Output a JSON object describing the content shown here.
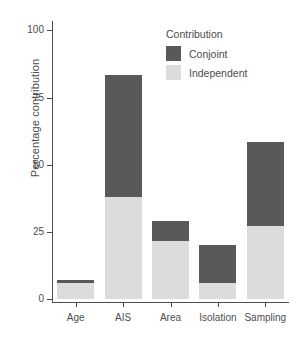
{
  "chart_data": {
    "type": "bar",
    "subtype": "stacked",
    "title": "",
    "xlabel": "",
    "ylabel": "Percentage contribution",
    "categories": [
      "Age",
      "AIS",
      "Area",
      "Isolation",
      "Sampling"
    ],
    "series": [
      {
        "name": "Independent",
        "color": "#dcdcdc",
        "values": [
          6,
          38,
          21.5,
          6,
          27
        ]
      },
      {
        "name": "Conjoint",
        "color": "#595959",
        "values": [
          1,
          45.5,
          7.5,
          14,
          31.5
        ]
      }
    ],
    "totals": [
      7,
      83.5,
      29,
      20,
      58.5
    ],
    "ylim": [
      0,
      100
    ],
    "yticks": [
      0,
      25,
      50,
      75,
      100
    ],
    "ytick_labels": [
      "0",
      "25",
      "50",
      "75",
      "100"
    ],
    "grid": false,
    "legend": {
      "title": "Contribution",
      "position": "inside-top-right",
      "entries": [
        {
          "label": "Conjoint",
          "color": "#595959"
        },
        {
          "label": "Independent",
          "color": "#dcdcdc"
        }
      ]
    }
  },
  "axes": {
    "y_title": "Percentage contribution",
    "y_ticks": [
      "100",
      "75",
      "50",
      "25",
      "0"
    ],
    "x_ticks": [
      "Age",
      "AIS",
      "Area",
      "Isolation",
      "Sampling"
    ]
  },
  "legend": {
    "title": "Contribution",
    "conjoint_label": "Conjoint",
    "independent_label": "Independent"
  },
  "colors": {
    "conjoint": "#595959",
    "independent": "#dcdcdc",
    "axis": "#4d4d4d",
    "background": "#ffffff"
  }
}
